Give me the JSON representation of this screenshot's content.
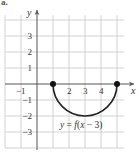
{
  "panel_label": "a.",
  "chart_data": {
    "type": "line",
    "title": "",
    "equation_label": "y = f(x − 3)",
    "xlabel": "x",
    "ylabel": "y",
    "xlim": [
      -2,
      5.5
    ],
    "ylim": [
      -4,
      4.5
    ],
    "grid": true,
    "x_tick_labels": [
      "−1",
      "2",
      "3",
      "4"
    ],
    "x_ticks": [
      -1,
      2,
      3,
      4
    ],
    "y_tick_labels": [
      "3",
      "2",
      "1",
      "−1",
      "−2",
      "−3"
    ],
    "y_ticks": [
      3,
      2,
      1,
      -1,
      -2,
      -3
    ],
    "series": [
      {
        "name": "y = f(x − 3)",
        "shape": "lower semicircle, center (3, 0), radius 2",
        "x": [
          1,
          1.5,
          2,
          2.5,
          3,
          3.5,
          4,
          4.5,
          5
        ],
        "y": [
          0,
          -1.32,
          -1.73,
          -1.94,
          -2,
          -1.94,
          -1.73,
          -1.32,
          0
        ],
        "endpoints": [
          [
            1,
            0
          ],
          [
            5,
            0
          ]
        ],
        "endpoint_style": "filled dot"
      }
    ]
  }
}
